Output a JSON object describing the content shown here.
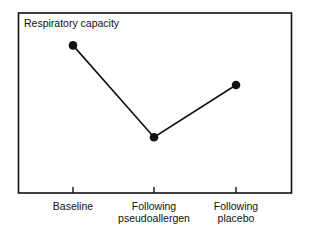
{
  "chart_data": {
    "type": "line",
    "title": "",
    "ylabel": "Respiratory capacity",
    "xlabel": "",
    "categories": [
      "Baseline",
      "Following pseudoallergen",
      "Following placebo"
    ],
    "category_lines": [
      [
        "Baseline"
      ],
      [
        "Following",
        "pseudoallergen"
      ],
      [
        "Following",
        "placebo"
      ]
    ],
    "values": [
      0.82,
      0.31,
      0.6
    ],
    "ylim": [
      0,
      1
    ],
    "grid": false,
    "y_ticks": "none",
    "marker": "filled-circle",
    "color": "#111111"
  }
}
